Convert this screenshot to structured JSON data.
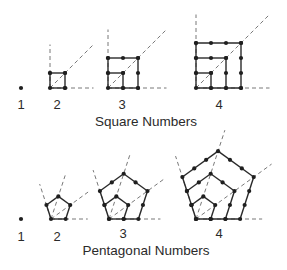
{
  "figure": {
    "colors": {
      "stroke": "#2a2a2a",
      "dash": "#6a6a6a",
      "dot": "#1f1f1f"
    },
    "square_section": {
      "caption": "Square Numbers",
      "caption_pos": [
        146,
        115
      ],
      "unit": 15,
      "items": [
        {
          "n": 1,
          "label": "1",
          "origin": [
            21,
            88
          ],
          "label_pos": [
            21,
            98
          ]
        },
        {
          "n": 2,
          "label": "2",
          "origin": [
            50,
            88
          ],
          "label_pos": [
            57,
            98
          ]
        },
        {
          "n": 3,
          "label": "3",
          "origin": [
            108,
            88
          ],
          "label_pos": [
            122,
            98
          ]
        },
        {
          "n": 4,
          "label": "4",
          "origin": [
            196,
            88
          ],
          "label_pos": [
            219,
            98
          ]
        }
      ]
    },
    "pentagon_section": {
      "caption": "Pentagonal  Numbers",
      "caption_pos": [
        146,
        244
      ],
      "unit": 14.7,
      "items": [
        {
          "n": 1,
          "label": "1",
          "origin": [
            21,
            219
          ],
          "label_pos": [
            21,
            230
          ]
        },
        {
          "n": 2,
          "label": "2",
          "origin": [
            51,
            219
          ],
          "label_pos": [
            57,
            230
          ]
        },
        {
          "n": 3,
          "label": "3",
          "origin": [
            109,
            219
          ],
          "label_pos": [
            123,
            227
          ]
        },
        {
          "n": 4,
          "label": "4",
          "origin": [
            196,
            219
          ],
          "label_pos": [
            219,
            227
          ]
        }
      ]
    }
  }
}
